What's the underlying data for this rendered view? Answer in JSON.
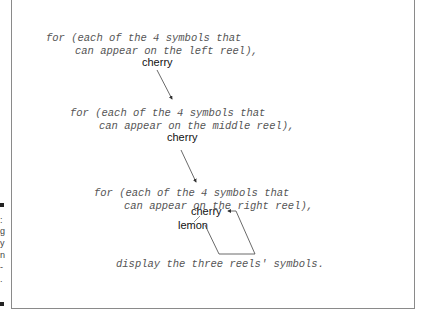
{
  "diagram": {
    "outer_loop": {
      "line1": "for (each of the 4 symbols that",
      "line2": "can appear on the left reel),",
      "value": "cherry"
    },
    "middle_loop": {
      "line1": "for (each of the 4 symbols that",
      "line2": "can appear on the middle reel),",
      "value": "cherry"
    },
    "inner_loop": {
      "line1": "for (each of the 4 symbols that",
      "line2": "can appear on the right reel),",
      "value_current": "cherry",
      "value_next": "lemon"
    },
    "body": "display the three reels' symbols."
  },
  "margin": {
    "chars": [
      ":",
      "g",
      "y",
      "n",
      "-",
      "."
    ]
  },
  "colors": {
    "code_text": "#555555",
    "value_text": "#111111",
    "frame_border": "#8a8a8a",
    "arrow": "#444444"
  }
}
